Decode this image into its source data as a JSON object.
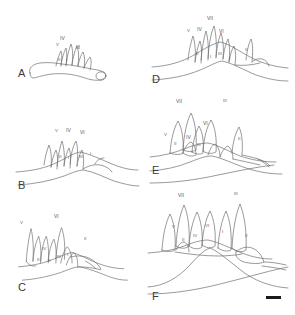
{
  "figure": {
    "title": "",
    "background_color": "#ffffff",
    "ink_color": "#6e6e72",
    "label_color": "#57575a",
    "panel_letter_color": "#3a3a3a",
    "scale_bar": {
      "name": "scale-bar",
      "color": "#1a1a1a",
      "caption": ""
    },
    "layout": {
      "columns": 2,
      "rows": 3,
      "order": [
        "A",
        "D",
        "B",
        "E",
        "C",
        "F"
      ]
    }
  },
  "panels": [
    {
      "id": "A",
      "letter": "A",
      "labels": [
        {
          "text": "IV",
          "x": 60,
          "y": 36
        },
        {
          "text": "V",
          "x": 56,
          "y": 43
        },
        {
          "text": "III",
          "x": 76,
          "y": 45
        },
        {
          "text": "II",
          "x": 58,
          "y": 58
        },
        {
          "text": "I",
          "x": 66,
          "y": 59
        }
      ]
    },
    {
      "id": "B",
      "letter": "B",
      "labels": [
        {
          "text": "V",
          "x": 55,
          "y": 129
        },
        {
          "text": "IV",
          "x": 66,
          "y": 128
        },
        {
          "text": "VI",
          "x": 80,
          "y": 130
        },
        {
          "text": "II",
          "x": 59,
          "y": 155
        },
        {
          "text": "I",
          "x": 68,
          "y": 156
        },
        {
          "text": "III",
          "x": 79,
          "y": 155
        },
        {
          "text": "I",
          "x": 90,
          "y": 152
        }
      ]
    },
    {
      "id": "C",
      "letter": "C",
      "labels": [
        {
          "text": "V",
          "x": 20,
          "y": 221
        },
        {
          "text": "VI",
          "x": 54,
          "y": 214
        },
        {
          "text": "II",
          "x": 84,
          "y": 237
        },
        {
          "text": "IV",
          "x": 42,
          "y": 247
        },
        {
          "text": "II",
          "x": 37,
          "y": 258
        },
        {
          "text": "II",
          "x": 48,
          "y": 259
        },
        {
          "text": "III",
          "x": 57,
          "y": 255
        },
        {
          "text": "I",
          "x": 67,
          "y": 253
        }
      ]
    },
    {
      "id": "D",
      "letter": "D",
      "labels": [
        {
          "text": "VII",
          "x": 207,
          "y": 16
        },
        {
          "text": "V",
          "x": 187,
          "y": 29
        },
        {
          "text": "IV",
          "x": 197,
          "y": 27
        },
        {
          "text": "VI",
          "x": 219,
          "y": 29
        },
        {
          "text": "II",
          "x": 196,
          "y": 52
        },
        {
          "text": "I",
          "x": 210,
          "y": 55
        },
        {
          "text": "III",
          "x": 218,
          "y": 52
        },
        {
          "text": "I",
          "x": 229,
          "y": 57
        },
        {
          "text": "II",
          "x": 245,
          "y": 48
        }
      ]
    },
    {
      "id": "E",
      "letter": "E",
      "labels": [
        {
          "text": "VII",
          "x": 176,
          "y": 99
        },
        {
          "text": "III",
          "x": 223,
          "y": 99
        },
        {
          "text": "VI",
          "x": 203,
          "y": 121
        },
        {
          "text": "V",
          "x": 164,
          "y": 133
        },
        {
          "text": "IV",
          "x": 186,
          "y": 135
        },
        {
          "text": "II",
          "x": 174,
          "y": 142
        },
        {
          "text": "III",
          "x": 197,
          "y": 143
        },
        {
          "text": "II",
          "x": 238,
          "y": 137
        }
      ]
    },
    {
      "id": "F",
      "letter": "F",
      "labels": [
        {
          "text": "VII",
          "x": 178,
          "y": 193
        },
        {
          "text": "III",
          "x": 234,
          "y": 192
        },
        {
          "text": "V",
          "x": 172,
          "y": 225
        },
        {
          "text": "VI",
          "x": 205,
          "y": 224
        },
        {
          "text": "IV",
          "x": 193,
          "y": 234
        },
        {
          "text": "II",
          "x": 182,
          "y": 238
        },
        {
          "text": "I",
          "x": 222,
          "y": 230
        },
        {
          "text": "II",
          "x": 245,
          "y": 234
        }
      ]
    }
  ]
}
